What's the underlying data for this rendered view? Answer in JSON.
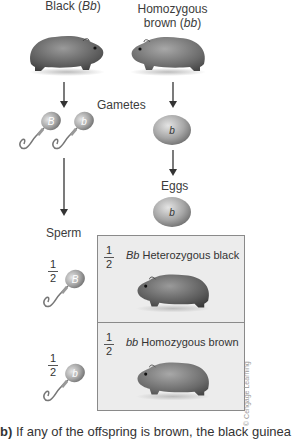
{
  "parents": {
    "left": {
      "label_prefix": "Black (",
      "genotype": "Bb",
      "label_suffix": ")"
    },
    "right": {
      "line1": "Homozygous",
      "line2_prefix": "brown (",
      "genotype": "bb",
      "line2_suffix": ")"
    }
  },
  "labels": {
    "gametes": "Gametes",
    "eggs": "Eggs",
    "sperm": "Sperm"
  },
  "gametes": {
    "sperm_top": [
      "B",
      "b"
    ],
    "egg_top": "b",
    "egg_bottom": "b",
    "sperm_row1": "B",
    "sperm_row2": "b"
  },
  "fractions": {
    "sperm_row1": {
      "num": "1",
      "den": "2"
    },
    "sperm_row2": {
      "num": "1",
      "den": "2"
    },
    "cell1": {
      "num": "1",
      "den": "2"
    },
    "cell2": {
      "num": "1",
      "den": "2"
    }
  },
  "offspring": [
    {
      "genotype": "Bb",
      "phenotype": "Heterozygous black"
    },
    {
      "genotype": "bb",
      "phenotype": "Homozygous brown"
    }
  ],
  "credit": "© Cengage Learning",
  "caption": {
    "prefix": "b)",
    "text": " If any of the offspring is brown, the black guinea"
  },
  "colors": {
    "box_fill": "#ececec",
    "box_border": "#8a8a8a",
    "gamete": "#9a9a9a"
  }
}
